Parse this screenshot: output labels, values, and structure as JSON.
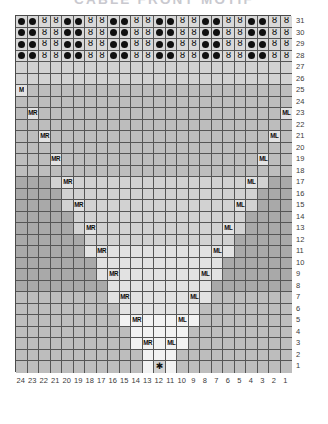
{
  "title": "CABLE FRONT MOTIF",
  "chart_data": {
    "type": "table",
    "title": "CABLE FRONT MOTIF",
    "chart_kind": "knitting-stitch-chart",
    "columns": 24,
    "rows": 31,
    "column_labels": [
      24,
      23,
      22,
      21,
      20,
      19,
      18,
      17,
      16,
      15,
      14,
      13,
      12,
      11,
      10,
      9,
      8,
      7,
      6,
      5,
      4,
      3,
      2,
      1
    ],
    "row_labels": [
      31,
      30,
      29,
      28,
      27,
      26,
      25,
      24,
      23,
      22,
      21,
      20,
      19,
      18,
      17,
      16,
      15,
      14,
      13,
      12,
      11,
      10,
      9,
      8,
      7,
      6,
      5,
      4,
      3,
      2,
      1
    ],
    "column_label_direction": "right-to-left",
    "row_label_direction": "bottom-to-top",
    "legend": [
      {
        "symbol": "dot",
        "glyph": "●",
        "name": "purl-stitch"
      },
      {
        "symbol": "twist",
        "glyph": "ȣ",
        "name": "twisted-stitch"
      },
      {
        "symbol": "MR",
        "glyph": "MR",
        "name": "make-one-right-increase"
      },
      {
        "symbol": "ML",
        "glyph": "ML",
        "name": "make-one-left-increase"
      },
      {
        "symbol": "M",
        "glyph": "M",
        "name": "make-one-increase"
      },
      {
        "symbol": "star",
        "glyph": "✱",
        "name": "center-start-marker"
      }
    ],
    "textured_band_rows": [
      31,
      30,
      29,
      28
    ],
    "textured_band_repeat": [
      "dot",
      "dot",
      "twist",
      "twist"
    ],
    "markers": [
      {
        "row": 25,
        "col": 24,
        "symbol": "M"
      },
      {
        "row": 23,
        "col": 23,
        "symbol": "MR"
      },
      {
        "row": 23,
        "col": 1,
        "symbol": "ML"
      },
      {
        "row": 21,
        "col": 22,
        "symbol": "MR"
      },
      {
        "row": 21,
        "col": 2,
        "symbol": "ML"
      },
      {
        "row": 19,
        "col": 21,
        "symbol": "MR"
      },
      {
        "row": 19,
        "col": 3,
        "symbol": "ML"
      },
      {
        "row": 17,
        "col": 20,
        "symbol": "MR"
      },
      {
        "row": 17,
        "col": 4,
        "symbol": "ML"
      },
      {
        "row": 15,
        "col": 19,
        "symbol": "MR"
      },
      {
        "row": 15,
        "col": 5,
        "symbol": "ML"
      },
      {
        "row": 13,
        "col": 18,
        "symbol": "MR"
      },
      {
        "row": 13,
        "col": 6,
        "symbol": "ML"
      },
      {
        "row": 11,
        "col": 17,
        "symbol": "MR"
      },
      {
        "row": 11,
        "col": 7,
        "symbol": "ML"
      },
      {
        "row": 9,
        "col": 16,
        "symbol": "MR"
      },
      {
        "row": 9,
        "col": 8,
        "symbol": "ML"
      },
      {
        "row": 7,
        "col": 15,
        "symbol": "MR"
      },
      {
        "row": 7,
        "col": 9,
        "symbol": "ML"
      },
      {
        "row": 5,
        "col": 14,
        "symbol": "MR"
      },
      {
        "row": 5,
        "col": 10,
        "symbol": "ML"
      },
      {
        "row": 3,
        "col": 13,
        "symbol": "MR"
      },
      {
        "row": 3,
        "col": 11,
        "symbol": "ML"
      },
      {
        "row": 1,
        "col": 12,
        "symbol": "star"
      }
    ]
  },
  "colors": {
    "background": "#ffffff",
    "grid_line": "#555555",
    "border": "#4a4a4a",
    "shade_dark": "#a9a9a9",
    "shade_mid": "#bdbdbd",
    "shade_light": "#d2d2d2",
    "shade_pale": "#e2e2e2",
    "shade_white": "#f2f2f2",
    "band": "#d8d8d8",
    "symbol": "#101010",
    "label_text": "#3a3a3a",
    "title_text": "#c9c9cf"
  }
}
